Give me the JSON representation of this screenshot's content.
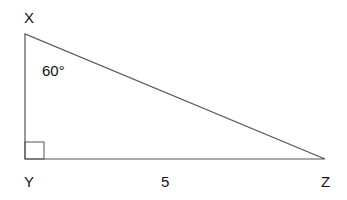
{
  "diagram": {
    "type": "right-triangle",
    "vertices": {
      "X": {
        "label": "X",
        "x": 25,
        "y": 34
      },
      "Y": {
        "label": "Y",
        "x": 25,
        "y": 159
      },
      "Z": {
        "label": "Z",
        "x": 325,
        "y": 159
      }
    },
    "angle_label": "60°",
    "angle_at": "X",
    "right_angle_at": "Y",
    "side_label": "5",
    "side_labeled": "YZ",
    "colors": {
      "lines": "#555555",
      "text": "#111111"
    }
  }
}
